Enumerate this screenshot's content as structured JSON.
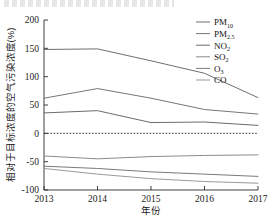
{
  "chart_data": {
    "type": "line",
    "title": "",
    "xlabel": "年份",
    "ylabel": "相对于目标浓度的空气污染浓度(%)",
    "x": [
      "2013",
      "2014",
      "2015",
      "2016",
      "2017"
    ],
    "categories": [
      "2013",
      "2014",
      "2015",
      "2016",
      "2017"
    ],
    "xtick_labels": [
      "2013",
      "2014",
      "2015",
      "2016",
      "2017"
    ],
    "ytick_labels": [
      "200",
      "150",
      "100",
      "50",
      "0",
      "-50",
      "-100"
    ],
    "ytick_values": [
      200,
      150,
      100,
      50,
      0,
      -50,
      -100
    ],
    "ylim": [
      -100,
      200
    ],
    "grid": false,
    "zero_reference_line": true,
    "legend_position": "top-right",
    "series": [
      {
        "name": "PM10",
        "label_main": "PM",
        "label_sub": "10",
        "color": "#6f6f6f",
        "values": [
          148,
          149,
          128,
          106,
          63
        ]
      },
      {
        "name": "PM2.5",
        "label_main": "PM",
        "label_sub": "2.5",
        "color": "#767676",
        "values": [
          62,
          79,
          62,
          42,
          34
        ]
      },
      {
        "name": "NO2",
        "label_main": "NO",
        "label_sub": "2",
        "color": "#6b6b6b",
        "values": [
          36,
          40,
          19,
          20,
          14
        ]
      },
      {
        "name": "SO2",
        "label_main": "SO",
        "label_sub": "2",
        "color": "#8a8a8a",
        "values": [
          -40,
          -45,
          -41,
          -39,
          -38
        ]
      },
      {
        "name": "O3",
        "label_main": "O",
        "label_sub": "3",
        "color": "#7a7a7a",
        "values": [
          -58,
          -62,
          -68,
          -72,
          -76
        ]
      },
      {
        "name": "CO",
        "label_main": "CO",
        "label_sub": "",
        "color": "#9a9a9a",
        "values": [
          -62,
          -72,
          -80,
          -85,
          -88
        ]
      }
    ]
  }
}
